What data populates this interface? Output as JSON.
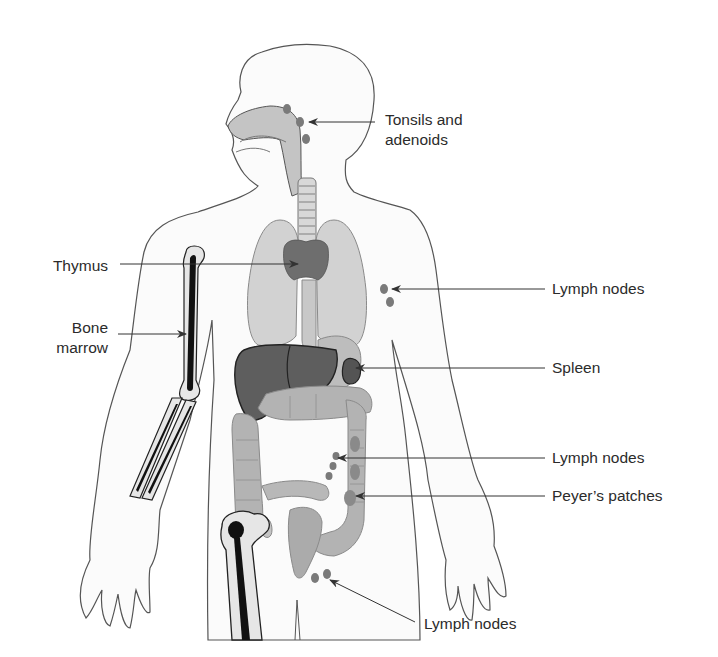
{
  "figure": {
    "colors": {
      "background": "#ffffff",
      "body_fill": "#fbfbfb",
      "outline": "#555555",
      "organ_light": "#cfcfcf",
      "organ_mid": "#a9a9a9",
      "organ_dark": "#6a6a6a",
      "organ_darker": "#565656",
      "bone_fill": "#e6e6e6",
      "marrow": "#111111",
      "node": "#7d7d7d",
      "arrow": "#333333",
      "text": "#2b2b2b"
    }
  },
  "labels": [
    {
      "id": "tonsils",
      "line1": "Tonsils and",
      "line2": "adenoids"
    },
    {
      "id": "thymus",
      "line1": "Thymus"
    },
    {
      "id": "bone-marrow",
      "line1": "Bone",
      "line2": "marrow"
    },
    {
      "id": "lymph-nodes-axillary",
      "line1": "Lymph nodes"
    },
    {
      "id": "spleen",
      "line1": "Spleen"
    },
    {
      "id": "lymph-nodes-mesenteric",
      "line1": "Lymph nodes"
    },
    {
      "id": "peyers-patches",
      "line1": "Peyer’s patches"
    },
    {
      "id": "lymph-nodes-inguinal",
      "line1": "Lymph nodes"
    }
  ]
}
